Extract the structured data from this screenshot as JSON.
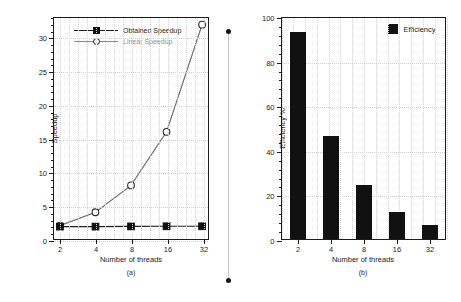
{
  "figure": {
    "divider_label": "panel-divider"
  },
  "panel_a": {
    "subcaption": "(a)",
    "xlabel": "Number of threads",
    "ylabel": "Speedup",
    "legend": [
      {
        "label": "Obtained Speedup",
        "marker": "filled-square"
      },
      {
        "label": "Linear Speedup",
        "marker": "open-circle"
      }
    ],
    "yticks": [
      "0",
      "5",
      "10",
      "15",
      "20",
      "25",
      "30"
    ],
    "xticks": [
      "2",
      "4",
      "8",
      "16",
      "32"
    ]
  },
  "panel_b": {
    "subcaption": "(b)",
    "xlabel": "Number of threads",
    "ylabel": "Efficiency %",
    "legend": [
      {
        "label": "Efficiency",
        "marker": "filled-square"
      }
    ],
    "yticks": [
      "0",
      "20",
      "40",
      "60",
      "80",
      "100"
    ],
    "xticks": [
      "2",
      "4",
      "8",
      "16",
      "32"
    ]
  },
  "chart_data": [
    {
      "type": "line",
      "title": "",
      "subcaption": "(a)",
      "xlabel": "Number of threads",
      "ylabel": "Speedup",
      "x": [
        2,
        4,
        8,
        16,
        32
      ],
      "xscale": "log2",
      "xlim": [
        2,
        32
      ],
      "ylim": [
        0,
        33
      ],
      "ytick_values": [
        0,
        5,
        10,
        15,
        20,
        25,
        30
      ],
      "grid": true,
      "legend_position": "top-left",
      "series": [
        {
          "name": "Obtained Speedup",
          "marker": "filled-square",
          "values": [
            1.85,
            1.85,
            1.88,
            1.9,
            1.9
          ]
        },
        {
          "name": "Linear Speedup",
          "marker": "open-circle",
          "values": [
            2,
            4,
            8,
            16,
            32
          ]
        }
      ]
    },
    {
      "type": "bar",
      "title": "",
      "subcaption": "(b)",
      "xlabel": "Number of threads",
      "ylabel": "Efficiency %",
      "categories": [
        "2",
        "4",
        "8",
        "16",
        "32"
      ],
      "values": [
        93,
        46,
        24,
        12,
        6.5
      ],
      "ylim": [
        0,
        100
      ],
      "ytick_values": [
        0,
        20,
        40,
        60,
        80,
        100
      ],
      "grid": true,
      "legend_position": "top-right",
      "series": [
        {
          "name": "Efficiency",
          "values": [
            93,
            46,
            24,
            12,
            6.5
          ]
        }
      ]
    }
  ]
}
